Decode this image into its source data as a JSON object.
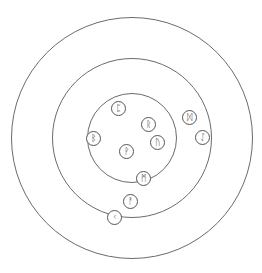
{
  "diagram": {
    "type": "concentric-rune-circles",
    "background": "#ffffff",
    "stroke_color": "#6b6b6b",
    "center": [
      132,
      138
    ],
    "rings": [
      {
        "name": "outer",
        "radius": 121
      },
      {
        "name": "middle",
        "radius": 80
      },
      {
        "name": "inner",
        "radius": 45
      }
    ],
    "runes": [
      {
        "glyph": "ᛈ",
        "name": "perthro",
        "x": 118,
        "y": 108
      },
      {
        "glyph": "ᚱ",
        "name": "raidho",
        "x": 148,
        "y": 124
      },
      {
        "glyph": "ᛒ",
        "name": "berkano",
        "x": 93,
        "y": 138
      },
      {
        "glyph": "ᚹ",
        "name": "wunjo",
        "x": 126,
        "y": 151
      },
      {
        "glyph": "ᚢ",
        "name": "uruz",
        "x": 157,
        "y": 142
      },
      {
        "glyph": "ᛞ",
        "name": "dagaz",
        "x": 189,
        "y": 117
      },
      {
        "glyph": "ᛇ",
        "name": "eihwaz",
        "x": 202,
        "y": 137
      },
      {
        "glyph": "ᛗ",
        "name": "mannaz",
        "x": 143,
        "y": 178
      },
      {
        "glyph": "ᚨ",
        "name": "ansuz",
        "x": 130,
        "y": 201
      },
      {
        "glyph": "ᚲ",
        "name": "kaunan",
        "x": 114,
        "y": 217
      }
    ]
  }
}
